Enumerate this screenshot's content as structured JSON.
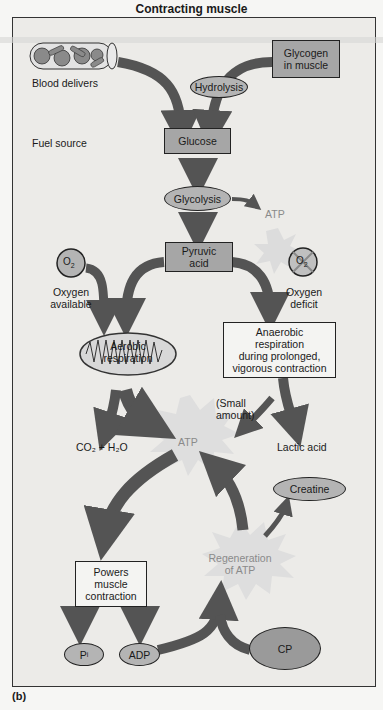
{
  "title": "Contracting muscle",
  "caption": "(b)",
  "nodes": {
    "blood_delivers": "Blood delivers",
    "glycogen_line1": "Glycogen",
    "glycogen_line2": "in muscle",
    "hydrolysis": "Hydrolysis",
    "fuel_source": "Fuel source",
    "glucose": "Glucose",
    "glycolysis": "Glycolysis",
    "atp_glycolysis": "ATP",
    "pyruvic_line1": "Pyruvic",
    "pyruvic_line2": "acid",
    "o2_available_symbol": "O",
    "o2_available_sub": "2",
    "oxygen_available_line1": "Oxygen",
    "oxygen_available_line2": "available",
    "o2_deficit_symbol": "O",
    "o2_deficit_sub": "2",
    "oxygen_deficit_line1": "Oxygen",
    "oxygen_deficit_line2": "deficit",
    "aerobic_line1": "Aerobic",
    "aerobic_line2": "respiration",
    "anaerobic_line1": "Anaerobic",
    "anaerobic_line2": "respiration",
    "anaerobic_line3": "during prolonged,",
    "anaerobic_line4": "vigorous contraction",
    "small_amount_line1": "(Small",
    "small_amount_line2": "amount)",
    "co2_h2o": "CO₂ + H₂O",
    "atp_main": "ATP",
    "lactic_acid": "Lactic acid",
    "creatine": "Creatine",
    "regeneration_line1": "Regeneration",
    "regeneration_line2": "of ATP",
    "powers_line1": "Powers",
    "powers_line2": "muscle",
    "powers_line3": "contraction",
    "pi_symbol": "P",
    "pi_sub": "i",
    "adp": "ADP",
    "cp": "CP"
  },
  "colors": {
    "arrow": "#545454",
    "box_fill": "#a6a6a6",
    "oval_fill": "#b4b4b4",
    "panel_bg": "#ecebe8",
    "burst": "#d9d9d9"
  }
}
